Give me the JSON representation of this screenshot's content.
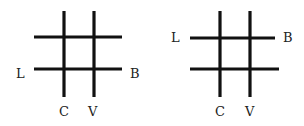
{
  "figures": [
    {
      "name": "left-grid",
      "labels": {
        "left": "L",
        "right": "B",
        "bottom_left": "C",
        "bottom_right": "V"
      },
      "label_row": "bottom"
    },
    {
      "name": "right-grid",
      "labels": {
        "left": "L",
        "right": "B",
        "bottom_left": "C",
        "bottom_right": "V"
      },
      "label_row": "top"
    }
  ],
  "colors": {
    "line": "#111111",
    "text": "#222222",
    "background": "#ffffff"
  }
}
